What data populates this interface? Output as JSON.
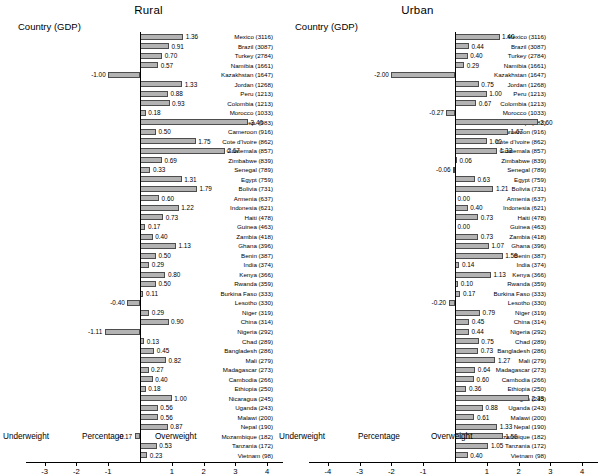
{
  "chart_data": {
    "type": "bar",
    "title": "",
    "orientation": "horizontal",
    "grid": false,
    "legend": false,
    "column_header": "Country (GDP)",
    "xlabel_center": "Percentage",
    "xlabel_left": "Underweight",
    "xlabel_right": "Overweight",
    "categories": [
      "Mexico (3116)",
      "Brazil (3087)",
      "Turkey (2784)",
      "Namibia (1661)",
      "Kazakhstan (1647)",
      "Jordan (1268)",
      "Peru (1213)",
      "Colombia (1213)",
      "Morocco (1033)",
      "Dominican Rep. (983)",
      "Cameroon (916)",
      "Cote d'Ivoire (862)",
      "Guatemala (857)",
      "Zimbabwe (839)",
      "Senegal (789)",
      "Egypt (759)",
      "Bolivia (731)",
      "Armenia (637)",
      "Indonesia (621)",
      "Haiti (478)",
      "Guinea (463)",
      "Zambia (418)",
      "Ghana (396)",
      "Benin (387)",
      "India (374)",
      "Kenya (366)",
      "Rwanda (359)",
      "Burkina Faso (333)",
      "Lesotho (330)",
      "Niger (319)",
      "China (314)",
      "Nigeria (292)",
      "Chad (289)",
      "Bangladesh (286)",
      "Mali (279)",
      "Madagascar (273)",
      "Cambodia (266)",
      "Ethiopia (250)",
      "Nicaragua (245)",
      "Uganda (243)",
      "Malawi (200)",
      "Nepal (190)",
      "Mozambique (182)",
      "Tanzania (172)",
      "Vietnam (98)"
    ],
    "panels": [
      {
        "name": "Rural",
        "xlim": [
          -3.6,
          4.5
        ],
        "xticks": [
          -3,
          -2,
          -1,
          1,
          2,
          3,
          4
        ],
        "xticklabels": [
          "-3",
          "-2",
          "-1",
          "1",
          "2",
          "3",
          "4"
        ],
        "values": [
          1.36,
          0.91,
          0.7,
          0.57,
          -1.0,
          1.33,
          0.88,
          0.93,
          0.18,
          3.4,
          0.5,
          1.75,
          2.67,
          0.69,
          0.33,
          1.31,
          1.79,
          0.6,
          1.22,
          0.73,
          0.17,
          0.4,
          1.13,
          0.5,
          0.29,
          0.8,
          0.5,
          0.11,
          -0.4,
          0.29,
          0.9,
          -1.11,
          0.13,
          0.45,
          0.82,
          0.27,
          0.4,
          0.18,
          1.0,
          0.56,
          0.56,
          0.87,
          -0.17,
          0.53,
          0.23
        ],
        "labels": [
          "1.36",
          "0.91",
          "0.70",
          "0.57",
          "-1.00",
          "1.33",
          "0.88",
          "0.93",
          "0.18",
          "3.40",
          "0.50",
          "1.75",
          "2.67",
          "0.69",
          "0.33",
          "1.31",
          "1.79",
          "0.60",
          "1.22",
          "0.73",
          "0.17",
          "0.40",
          "1.13",
          "0.50",
          "0.29",
          "0.80",
          "0.50",
          "0.11",
          "-0.40",
          "0.29",
          "0.90",
          "-1.11",
          "0.13",
          "0.45",
          "0.82",
          "0.27",
          "0.40",
          "0.18",
          "1.00",
          "0.56",
          "0.56",
          "0.87",
          "-0.17",
          "0.53",
          "0.23"
        ]
      },
      {
        "name": "Urban",
        "xlim": [
          -4.6,
          4.5
        ],
        "xticks": [
          -4,
          -3,
          -2,
          -1,
          1,
          2,
          3,
          4
        ],
        "xticklabels": [
          "-4",
          "-3",
          "-2",
          "-1",
          "1",
          "2",
          "3",
          "4"
        ],
        "values": [
          1.4,
          0.44,
          0.4,
          0.29,
          -2.0,
          0.75,
          1.0,
          0.67,
          -0.27,
          2.6,
          1.67,
          1.0,
          1.33,
          0.06,
          -0.06,
          0.63,
          1.21,
          0.0,
          0.4,
          0.73,
          0.0,
          0.73,
          1.07,
          1.5,
          0.14,
          1.13,
          0.1,
          0.17,
          -0.2,
          0.79,
          0.45,
          0.44,
          0.75,
          0.73,
          1.27,
          0.64,
          0.6,
          0.36,
          2.33,
          0.88,
          0.61,
          1.33,
          1.5,
          1.05,
          0.4
        ],
        "labels": [
          "1.40",
          "0.44",
          "0.40",
          "0.29",
          "-2.00",
          "0.75",
          "1.00",
          "0.67",
          "-0.27",
          "2.60",
          "1.67",
          "1.00",
          "1.33",
          "0.06",
          "-0.06",
          "0.63",
          "1.21",
          "0.00",
          "0.40",
          "0.73",
          "0.00",
          "0.73",
          "1.07",
          "1.50",
          "0.14",
          "1.13",
          "0.10",
          "0.17",
          "-0.20",
          "0.79",
          "0.45",
          "0.44",
          "0.75",
          "0.73",
          "1.27",
          "0.64",
          "0.60",
          "0.36",
          "2.33",
          "0.88",
          "0.61",
          "1.33",
          "1.50",
          "1.05",
          "0.40"
        ]
      }
    ],
    "colors": {
      "bar_fill": "#b3b3b3",
      "bar_edge": "#4d4d4d",
      "axis": "#000000"
    }
  }
}
